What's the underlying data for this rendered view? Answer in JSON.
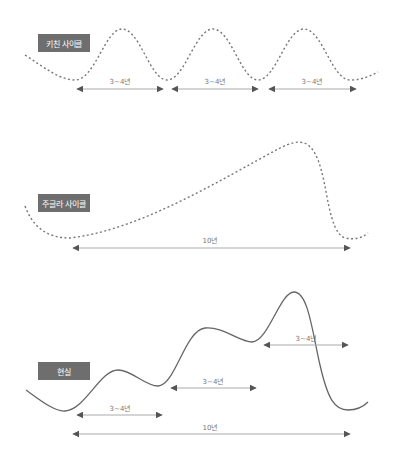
{
  "panels": [
    {
      "label": "키친 사이클",
      "line_style": "dashed",
      "durations": [
        "3~4년",
        "3~4년",
        "3~4년"
      ]
    },
    {
      "label": "주글라 사이클",
      "line_style": "dashed",
      "durations": [
        "10년"
      ]
    },
    {
      "label": "현실",
      "line_style": "solid",
      "durations": [
        "3~4년",
        "3~4년",
        "3~4년",
        "10년"
      ]
    }
  ],
  "colors": {
    "label_bg": "#6e6e6e",
    "label_text": "#ffffff",
    "curve": "#666666",
    "arrow": "#555555",
    "arrow_line": "#aaaaaa"
  }
}
